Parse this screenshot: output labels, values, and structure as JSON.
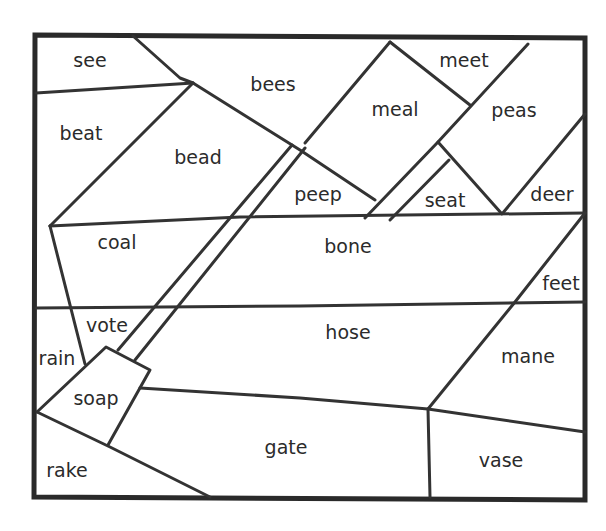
{
  "worksheet": {
    "colors": {
      "ink": "#333333",
      "background": "#ffffff"
    },
    "regions": [
      {
        "word": "see",
        "x": 90,
        "y": 60
      },
      {
        "word": "bees",
        "x": 273,
        "y": 84
      },
      {
        "word": "meet",
        "x": 464,
        "y": 60
      },
      {
        "word": "meal",
        "x": 395,
        "y": 109
      },
      {
        "word": "peas",
        "x": 514,
        "y": 110
      },
      {
        "word": "beat",
        "x": 81,
        "y": 133
      },
      {
        "word": "bead",
        "x": 198,
        "y": 157
      },
      {
        "word": "peep",
        "x": 318,
        "y": 194
      },
      {
        "word": "seat",
        "x": 445,
        "y": 200
      },
      {
        "word": "deer",
        "x": 552,
        "y": 194
      },
      {
        "word": "coal",
        "x": 117,
        "y": 242
      },
      {
        "word": "bone",
        "x": 348,
        "y": 246
      },
      {
        "word": "feet",
        "x": 561,
        "y": 283
      },
      {
        "word": "vote",
        "x": 107,
        "y": 325
      },
      {
        "word": "hose",
        "x": 348,
        "y": 332
      },
      {
        "word": "rain",
        "x": 57,
        "y": 358
      },
      {
        "word": "mane",
        "x": 528,
        "y": 356
      },
      {
        "word": "soap",
        "x": 96,
        "y": 398
      },
      {
        "word": "gate",
        "x": 286,
        "y": 447
      },
      {
        "word": "vase",
        "x": 501,
        "y": 460
      },
      {
        "word": "rake",
        "x": 67,
        "y": 470
      }
    ]
  }
}
